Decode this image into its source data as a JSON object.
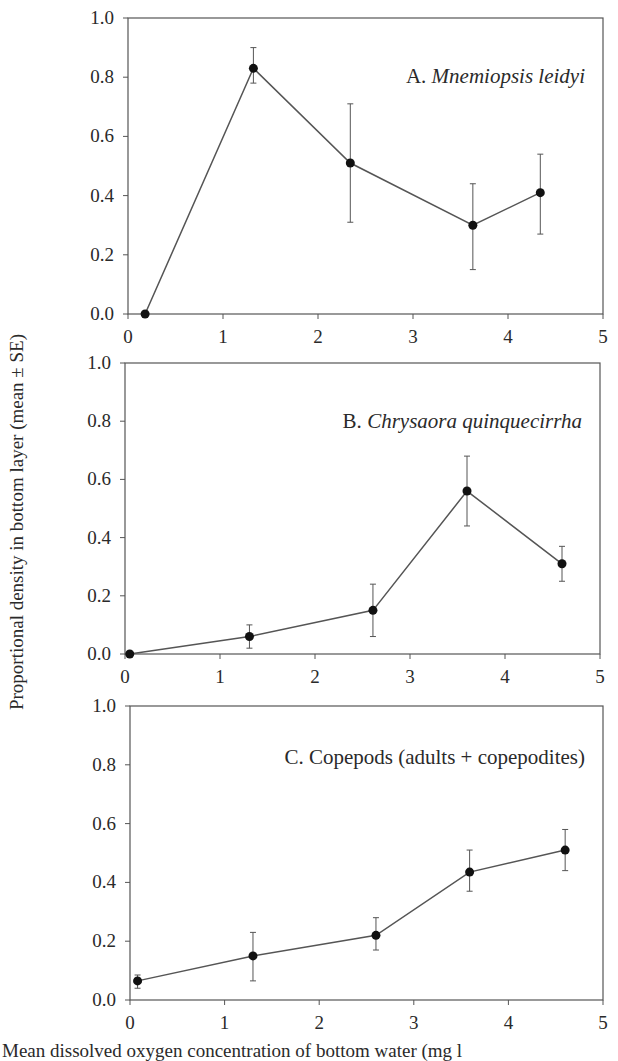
{
  "figure": {
    "ylabel": "Proportional density in bottom layer (mean ± SE)",
    "xlabel_partial": "Mean dissolved oxygen concentration of bottom water (mg l"
  },
  "style": {
    "line_color": "#555555",
    "marker_color": "#111111",
    "axis_color": "#555555",
    "text_color": "#2a2a2a"
  },
  "chart_data": [
    {
      "type": "line",
      "title": "A. Mnemiopsis leidyi",
      "title_prefix": "A. ",
      "title_italic": "Mnemiopsis leidyi",
      "xlabel": "Mean dissolved oxygen concentration of bottom water (mg l",
      "ylabel": "Proportional density in bottom layer (mean ± SE)",
      "xlim": [
        0,
        5
      ],
      "ylim": [
        0,
        1.0
      ],
      "xticks": [
        0,
        1,
        2,
        3,
        4,
        5
      ],
      "yticks": [
        "0.0",
        "0.2",
        "0.4",
        "0.6",
        "0.8",
        "1.0"
      ],
      "grid": false,
      "series": [
        {
          "name": "Mnemiopsis leidyi",
          "x": [
            0.18,
            1.32,
            2.34,
            3.63,
            4.34
          ],
          "y": [
            0.0,
            0.83,
            0.51,
            0.3,
            0.41
          ],
          "err_low": [
            0.0,
            0.78,
            0.31,
            0.15,
            0.27
          ],
          "err_high": [
            0.0,
            0.9,
            0.71,
            0.44,
            0.54
          ]
        }
      ],
      "frame": {
        "left": 128,
        "right": 603,
        "top": 18,
        "bottom": 314
      }
    },
    {
      "type": "line",
      "title": "B. Chrysaora quinquecirrha",
      "title_prefix": "B. ",
      "title_italic": "Chrysaora quinquecirrha",
      "xlim": [
        0,
        5
      ],
      "ylim": [
        0,
        1.0
      ],
      "xticks": [
        0,
        1,
        2,
        3,
        4,
        5
      ],
      "yticks": [
        "0.0",
        "0.2",
        "0.4",
        "0.6",
        "0.8",
        "1.0"
      ],
      "grid": false,
      "series": [
        {
          "name": "Chrysaora quinquecirrha",
          "x": [
            0.05,
            1.31,
            2.61,
            3.6,
            4.6
          ],
          "y": [
            0.0,
            0.06,
            0.15,
            0.56,
            0.31
          ],
          "err_low": [
            0.0,
            0.02,
            0.06,
            0.44,
            0.25
          ],
          "err_high": [
            0.0,
            0.1,
            0.24,
            0.68,
            0.37
          ]
        }
      ],
      "frame": {
        "left": 125,
        "right": 600,
        "top": 363,
        "bottom": 654
      }
    },
    {
      "type": "line",
      "title": "C. Copepods (adults + copepodites)",
      "title_prefix": "C. Copepods (adults + copepodites)",
      "title_italic": "",
      "xlim": [
        0,
        5
      ],
      "ylim": [
        0,
        1.0
      ],
      "xticks": [
        0,
        1,
        2,
        3,
        4,
        5
      ],
      "yticks": [
        "0.0",
        "0.2",
        "0.4",
        "0.6",
        "0.8",
        "1.0"
      ],
      "grid": false,
      "series": [
        {
          "name": "Copepods (adults + copepodites)",
          "x": [
            0.08,
            1.3,
            2.6,
            3.59,
            4.6
          ],
          "y": [
            0.065,
            0.15,
            0.22,
            0.435,
            0.51
          ],
          "err_low": [
            0.04,
            0.065,
            0.17,
            0.37,
            0.44
          ],
          "err_high": [
            0.085,
            0.23,
            0.28,
            0.51,
            0.58
          ]
        }
      ],
      "frame": {
        "left": 130,
        "right": 603,
        "top": 706,
        "bottom": 1000
      }
    }
  ]
}
